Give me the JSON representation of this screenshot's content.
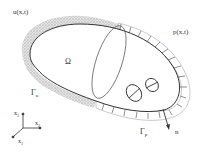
{
  "diagram": {
    "labels": {
      "displacement": "u(x,t)",
      "pressure": "p(x,t)",
      "domain": "Ω",
      "gamma_u": "Γ",
      "gamma_u_sub": "u",
      "gamma_p": "Γ",
      "gamma_p_sub": "p",
      "normal": "n"
    },
    "axes": {
      "x1": "x",
      "x1_sub": "1",
      "x2": "x",
      "x2_sub": "2",
      "x3": "x",
      "x3_sub": "3"
    },
    "colors": {
      "outline": "#333333",
      "stipple": "#bdbdbd",
      "pressure_band": "#c8c8c8"
    }
  }
}
